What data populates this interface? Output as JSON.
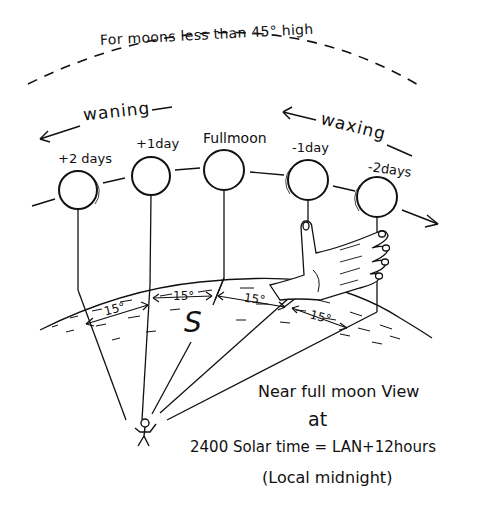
{
  "diagram": {
    "title": "For moons less than 45° high",
    "direction_labels": {
      "waning": "waning",
      "waxing": "waxing"
    },
    "moons": [
      {
        "label": "+2 days",
        "cx": 78,
        "cy": 190
      },
      {
        "label": "+1day",
        "cx": 151,
        "cy": 176
      },
      {
        "label": "Fullmoon",
        "cx": 224,
        "cy": 170
      },
      {
        "label": "-1day",
        "cx": 308,
        "cy": 180
      },
      {
        "label": "-2days",
        "cx": 377,
        "cy": 197
      }
    ],
    "angle_labels": [
      "15°",
      "15°",
      "15°",
      "15°"
    ],
    "south_marker": "S",
    "caption": {
      "line1": "Near full moon View",
      "line2": "at",
      "line3": "2400 Solar time = LAN+12hours",
      "line4": "(Local midnight)"
    },
    "colors": {
      "ink": "#111111",
      "background": "#ffffff"
    }
  }
}
